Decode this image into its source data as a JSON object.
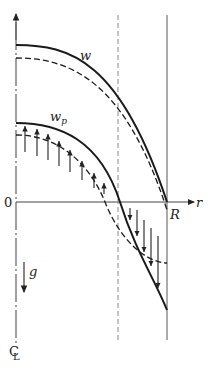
{
  "figure": {
    "type": "diagram",
    "labels": {
      "w": "w",
      "w_p": "w",
      "w_p_sub": "p",
      "origin": "0",
      "r_axis": "r",
      "radius": "R",
      "gravity": "g",
      "centerline": "C",
      "centerline_sub": "L"
    },
    "colors": {
      "curve": "#1a1a1a",
      "axis": "#555555",
      "dashed_guide": "#888888"
    },
    "curves": [
      {
        "name": "w",
        "style": "solid"
      },
      {
        "name": "w-dashed",
        "style": "dashed"
      },
      {
        "name": "w_p",
        "style": "solid",
        "arrows": "relative velocity vectors"
      },
      {
        "name": "w_p-dashed",
        "style": "dashed"
      }
    ]
  }
}
